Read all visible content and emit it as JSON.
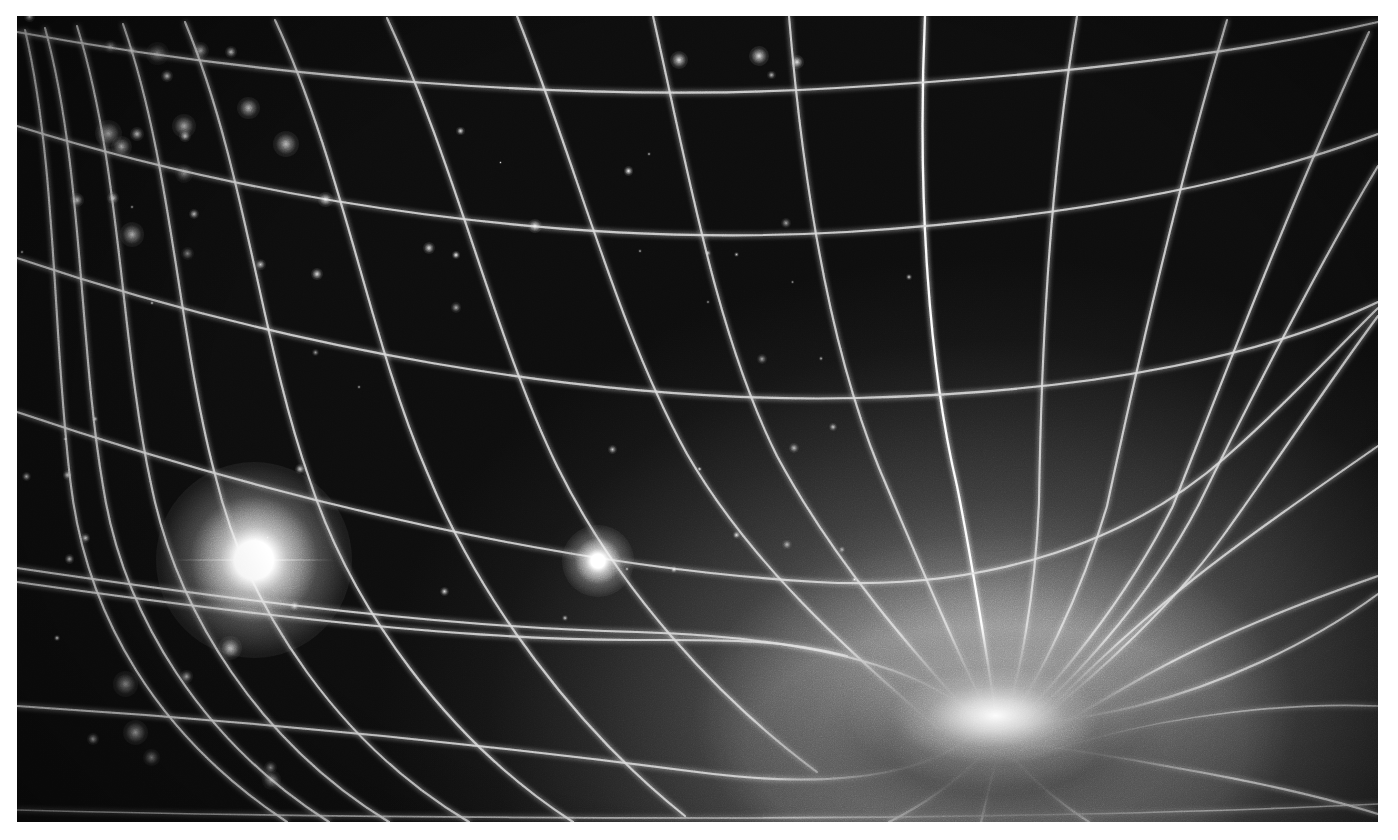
{
  "figure": {
    "caption": "",
    "medium": "grayscale astronomical rendering",
    "palette": {
      "page_background": "#ffffff",
      "space_dark": "#0d0d0d",
      "space_mid": "#3a3a3a",
      "glow_bright": "#b9b9b9",
      "gridline": "#d9d9d9",
      "star_core": "#ffffff"
    },
    "plate": {
      "x": 17,
      "y": 16,
      "width": 1361,
      "height": 806
    }
  },
  "scene": {
    "description": "Warped coordinate grid depicting curved spacetime funnelling into a massive compact object at lower right, with two foreground stars and a distant galaxy field at upper and lower left.",
    "well": {
      "label": "gravity-well-center",
      "x_pct": 71.9,
      "y_pct": 86.8,
      "intensity": 1.0
    },
    "stars": [
      {
        "label": "bright-star-left",
        "x": 252,
        "y": 558,
        "radius": 96,
        "core": 13,
        "brightness": 1.0
      },
      {
        "label": "bright-star-center",
        "x": 596,
        "y": 576,
        "radius": 34,
        "core": 7,
        "brightness": 0.85
      }
    ],
    "grid": {
      "type": "curvilinear",
      "radial_lines": 13,
      "ring_lines": 6,
      "stroke": "#d9d9d9",
      "note": "radial geodesics converge on the well; rings are constant-radius contours stretched by curvature"
    },
    "starfield": {
      "cluster_upper_left_count": 14,
      "cluster_lower_left_count": 9,
      "scattered_count": 46
    }
  },
  "chart_data": {
    "type": "scatter",
    "xlabel": "",
    "ylabel": "",
    "categories": [
      "gravity-well",
      "bright-star-left",
      "bright-star-center"
    ],
    "values": [
      1.0,
      1.0,
      0.85
    ],
    "annotations": [
      "warped coordinate grid",
      "radial geodesics converging on central mass",
      "distant galaxy field"
    ]
  }
}
